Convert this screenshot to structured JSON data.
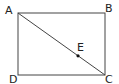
{
  "diagram": {
    "type": "geometry",
    "shape": "rectangle ABCD with diagonal AC and point E on AC",
    "stroke_color": "#333333",
    "points": {
      "A": {
        "label": "A",
        "x": 18,
        "y": 13
      },
      "B": {
        "label": "B",
        "x": 105,
        "y": 13
      },
      "C": {
        "label": "C",
        "x": 105,
        "y": 75
      },
      "D": {
        "label": "D",
        "x": 18,
        "y": 75
      },
      "E": {
        "label": "E",
        "x": 78,
        "y": 56
      }
    },
    "segments": [
      [
        "A",
        "B"
      ],
      [
        "B",
        "C"
      ],
      [
        "C",
        "D"
      ],
      [
        "D",
        "A"
      ],
      [
        "A",
        "C"
      ]
    ]
  }
}
